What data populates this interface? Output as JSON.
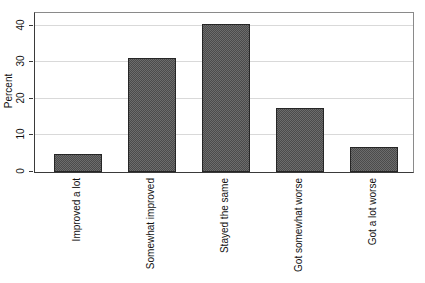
{
  "figure": {
    "background": "#ffffff"
  },
  "chart_data": {
    "type": "bar",
    "title": "",
    "xlabel": "",
    "ylabel": "Percent",
    "categories": [
      "Improved a lot",
      "Somewhat improved",
      "Stayed the same",
      "Got somewhat worse",
      "Got a lot worse"
    ],
    "values": [
      4.9,
      31.1,
      40.4,
      17.5,
      6.9
    ],
    "yticks": [
      0,
      10,
      20,
      30,
      40
    ],
    "ylim": [
      0,
      43.5
    ],
    "grid": "horizontal",
    "legend": false,
    "tick_label_rotation_deg": 90,
    "bar_fill_color": "#5c5c5c",
    "bar_border_color": "#262626",
    "gridline_color": "#d9d9d9",
    "frame_color": "#8a8a8a",
    "axis_color": "#3a3a3a",
    "text_color": "#111111"
  }
}
